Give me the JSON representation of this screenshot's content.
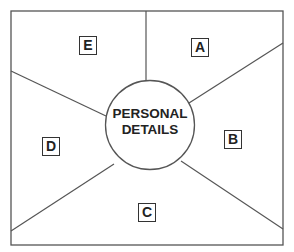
{
  "diagram": {
    "center": {
      "line1": "PERSONAL",
      "line2": "DETAILS"
    },
    "segments": [
      {
        "label": "A"
      },
      {
        "label": "B"
      },
      {
        "label": "C"
      },
      {
        "label": "D"
      },
      {
        "label": "E"
      }
    ],
    "colors": {
      "line": "#444444",
      "background": "#ffffff",
      "text": "#222222"
    }
  }
}
